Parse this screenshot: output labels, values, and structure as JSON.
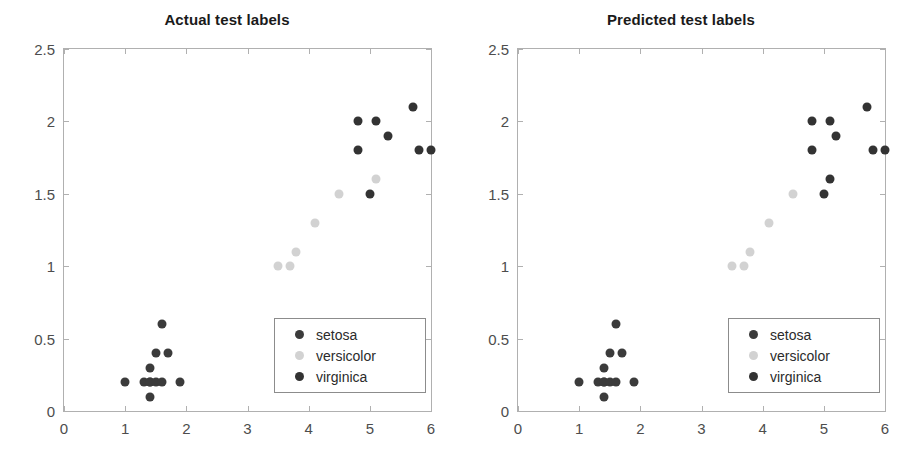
{
  "figure": {
    "background": "#ffffff",
    "width": 908,
    "height": 471
  },
  "colors": {
    "setosa": "#3b3b3b",
    "versicolor": "#d2d2d2",
    "virginica": "#333333",
    "axis": "#b0b0b0",
    "tick_text": "#4d4d4d",
    "title_text": "#1a1a1a"
  },
  "legend": {
    "entries": [
      {
        "label": "setosa",
        "color": "#3b3b3b"
      },
      {
        "label": "versicolor",
        "color": "#d2d2d2"
      },
      {
        "label": "virginica",
        "color": "#333333"
      }
    ],
    "position": "southeast"
  },
  "axis": {
    "xlim": [
      0,
      6
    ],
    "ylim": [
      0,
      2.5
    ],
    "xticks": [
      "0",
      "1",
      "2",
      "3",
      "4",
      "5",
      "6"
    ],
    "xtick_values": [
      0,
      1,
      2,
      3,
      4,
      5,
      6
    ],
    "yticks": [
      "0",
      "0.5",
      "1",
      "1.5",
      "2",
      "2.5"
    ],
    "ytick_values": [
      0,
      0.5,
      1,
      1.5,
      2,
      2.5
    ],
    "grid": false,
    "box": true
  },
  "chart_data": [
    {
      "type": "scatter",
      "title": "Actual test labels",
      "xlabel": "",
      "ylabel": "",
      "xlim": [
        0,
        6
      ],
      "ylim": [
        0,
        2.5
      ],
      "xticks": [
        0,
        1,
        2,
        3,
        4,
        5,
        6
      ],
      "yticks": [
        0,
        0.5,
        1,
        1.5,
        2,
        2.5
      ],
      "grid": false,
      "legend_position": "southeast",
      "series": [
        {
          "name": "setosa",
          "color": "#3b3b3b",
          "points": [
            [
              1.0,
              0.2
            ],
            [
              1.3,
              0.2
            ],
            [
              1.4,
              0.2
            ],
            [
              1.4,
              0.2
            ],
            [
              1.5,
              0.2
            ],
            [
              1.6,
              0.2
            ],
            [
              1.9,
              0.2
            ],
            [
              1.4,
              0.1
            ],
            [
              1.4,
              0.3
            ],
            [
              1.5,
              0.4
            ],
            [
              1.7,
              0.4
            ],
            [
              1.6,
              0.6
            ]
          ]
        },
        {
          "name": "versicolor",
          "color": "#d2d2d2",
          "points": [
            [
              3.5,
              1.0
            ],
            [
              3.7,
              1.0
            ],
            [
              3.8,
              1.1
            ],
            [
              4.1,
              1.3
            ],
            [
              4.5,
              1.5
            ],
            [
              5.1,
              1.6
            ]
          ]
        },
        {
          "name": "virginica",
          "color": "#333333",
          "points": [
            [
              4.8,
              1.8
            ],
            [
              4.8,
              2.0
            ],
            [
              5.1,
              2.0
            ],
            [
              5.3,
              1.9
            ],
            [
              5.7,
              2.1
            ],
            [
              5.8,
              1.8
            ],
            [
              6.0,
              1.8
            ],
            [
              5.0,
              1.5
            ]
          ]
        }
      ]
    },
    {
      "type": "scatter",
      "title": "Predicted test labels",
      "xlabel": "",
      "ylabel": "",
      "xlim": [
        0,
        6
      ],
      "ylim": [
        0,
        2.5
      ],
      "xticks": [
        0,
        1,
        2,
        3,
        4,
        5,
        6
      ],
      "yticks": [
        0,
        0.5,
        1,
        1.5,
        2,
        2.5
      ],
      "grid": false,
      "legend_position": "southeast",
      "series": [
        {
          "name": "setosa",
          "color": "#3b3b3b",
          "points": [
            [
              1.0,
              0.2
            ],
            [
              1.3,
              0.2
            ],
            [
              1.4,
              0.2
            ],
            [
              1.4,
              0.2
            ],
            [
              1.5,
              0.2
            ],
            [
              1.6,
              0.2
            ],
            [
              1.9,
              0.2
            ],
            [
              1.4,
              0.1
            ],
            [
              1.4,
              0.3
            ],
            [
              1.5,
              0.4
            ],
            [
              1.7,
              0.4
            ],
            [
              1.6,
              0.6
            ]
          ]
        },
        {
          "name": "versicolor",
          "color": "#d2d2d2",
          "points": [
            [
              3.5,
              1.0
            ],
            [
              3.7,
              1.0
            ],
            [
              3.8,
              1.1
            ],
            [
              4.1,
              1.3
            ],
            [
              4.5,
              1.5
            ]
          ]
        },
        {
          "name": "virginica",
          "color": "#333333",
          "points": [
            [
              4.8,
              1.8
            ],
            [
              4.8,
              2.0
            ],
            [
              5.1,
              2.0
            ],
            [
              5.2,
              1.9
            ],
            [
              5.7,
              2.1
            ],
            [
              5.8,
              1.8
            ],
            [
              6.0,
              1.8
            ],
            [
              5.0,
              1.5
            ],
            [
              5.1,
              1.6
            ]
          ]
        }
      ]
    }
  ]
}
